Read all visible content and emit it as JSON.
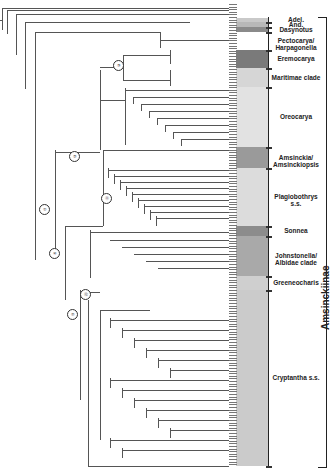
{
  "figure": {
    "type": "phylogenetic-tree",
    "subfamily_label": "Amsinckiinae",
    "outgroup_tips": [
      "Hac. minnanthe",
      "M. sp.",
      "M. sp.",
      "M. sp."
    ],
    "clades": [
      {
        "id": "adel",
        "label": "Adel.",
        "y_top": 18,
        "y_bottom": 22,
        "shade": "#c9c9c9"
      },
      {
        "id": "and",
        "label": "And.",
        "y_top": 22,
        "y_bottom": 27,
        "shade": "#b8b8b8"
      },
      {
        "id": "dasynotus",
        "label": "Dasynotus",
        "y_top": 27,
        "y_bottom": 32,
        "shade": "#8a8a8a"
      },
      {
        "id": "pectocarya",
        "label": "Pectocarya/ Harpagonella",
        "y_top": 32,
        "y_bottom": 50,
        "shade": "#ffffff"
      },
      {
        "id": "eremocarya",
        "label": "Eremocarya",
        "y_top": 50,
        "y_bottom": 68,
        "shade": "#7a7a7a"
      },
      {
        "id": "maritimae",
        "label": "Maritimae clade",
        "y_top": 68,
        "y_bottom": 87,
        "shade": "#d6d6d6"
      },
      {
        "id": "oreocarya",
        "label": "Oreocarya",
        "y_top": 87,
        "y_bottom": 147,
        "shade": "#e2e2e2"
      },
      {
        "id": "amsinckia",
        "label": "Amsinckia/ Amsinckiopsis",
        "y_top": 147,
        "y_bottom": 168,
        "shade": "#9a9a9a"
      },
      {
        "id": "plagiobothrys",
        "label": "Plagiobothrys s.s.",
        "y_top": 168,
        "y_bottom": 226,
        "shade": "#dcdcdc"
      },
      {
        "id": "sonnea",
        "label": "Sonnea",
        "y_top": 226,
        "y_bottom": 236,
        "shade": "#8c8c8c"
      },
      {
        "id": "johnstonella",
        "label": "Johnstonella/ Albidae clade",
        "y_top": 236,
        "y_bottom": 276,
        "shade": "#a9a9a9"
      },
      {
        "id": "greeneocharis",
        "label": "Greeneocharis",
        "y_top": 276,
        "y_bottom": 290,
        "shade": "#cfcfcf"
      },
      {
        "id": "cryptantha",
        "label": "Cryptantha s.s.",
        "y_top": 290,
        "y_bottom": 466,
        "shade": "#cbcbcb"
      }
    ],
    "circled_nodes": [
      {
        "label": "③",
        "x": 118,
        "y": 65
      },
      {
        "label": "②",
        "x": 74,
        "y": 156
      },
      {
        "label": "⑪",
        "x": 106,
        "y": 198
      },
      {
        "label": "①",
        "x": 44,
        "y": 209
      },
      {
        "label": "④",
        "x": 54,
        "y": 253
      },
      {
        "label": "⑫",
        "x": 85,
        "y": 294
      },
      {
        "label": "⑤",
        "x": 72,
        "y": 314
      }
    ],
    "support_value_format": "PP/BS"
  }
}
